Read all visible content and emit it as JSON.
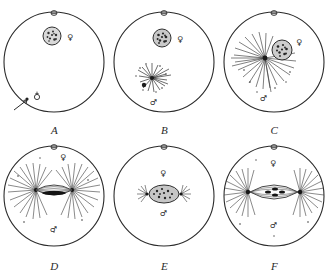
{
  "figure": {
    "background_color": "#ffffff",
    "ink_color": "#262626",
    "panel_count": 6,
    "columns": 3,
    "rows": 2
  },
  "symbols": {
    "female": "♀",
    "male": "♂",
    "female_name": "venus-female-symbol",
    "male_name": "mars-male-symbol"
  },
  "panels": [
    {
      "letter": "A",
      "top_mark": "♀",
      "female_label": "♀",
      "male_label": "♂",
      "has_arrow": true,
      "has_spindle": false,
      "aster_count": 0
    },
    {
      "letter": "B",
      "top_mark": "♀",
      "female_label": "♀",
      "male_label": "♂",
      "has_arrow": false,
      "has_spindle": false,
      "aster_count": 1
    },
    {
      "letter": "C",
      "top_mark": "♀",
      "female_label": "♀",
      "male_label": "♂",
      "has_arrow": false,
      "has_spindle": false,
      "aster_count": 1
    },
    {
      "letter": "D",
      "top_mark": "♀",
      "female_label": "♀",
      "male_label": "♂",
      "has_arrow": false,
      "has_spindle": true,
      "aster_count": 2
    },
    {
      "letter": "E",
      "top_mark": "♀",
      "female_label": "♀",
      "male_label": "♂",
      "has_arrow": false,
      "has_spindle": true,
      "aster_count": 2
    },
    {
      "letter": "F",
      "top_mark": "♀",
      "female_label": "♀",
      "male_label": "♂",
      "has_arrow": false,
      "has_spindle": true,
      "aster_count": 2
    }
  ]
}
